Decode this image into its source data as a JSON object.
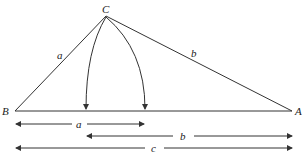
{
  "diagram": {
    "vertices": {
      "C": {
        "label": "C",
        "x": 106,
        "y": 16
      },
      "B": {
        "label": "B",
        "x": 15,
        "y": 111
      },
      "A": {
        "label": "A",
        "x": 292,
        "y": 111
      }
    },
    "side_labels": {
      "BC": "a",
      "CA": "b"
    },
    "arc_targets": [
      86,
      145
    ],
    "dimensions": [
      {
        "label": "a",
        "from": 15,
        "to": 145,
        "y": 124,
        "label_x": 79
      },
      {
        "label": "b",
        "from": 86,
        "to": 292,
        "y": 136,
        "label_x": 183
      },
      {
        "label": "c",
        "from": 15,
        "to": 292,
        "y": 148,
        "label_x": 154
      }
    ],
    "colors": {
      "line": "#333333",
      "text": "#222222",
      "background": "#ffffff"
    }
  }
}
